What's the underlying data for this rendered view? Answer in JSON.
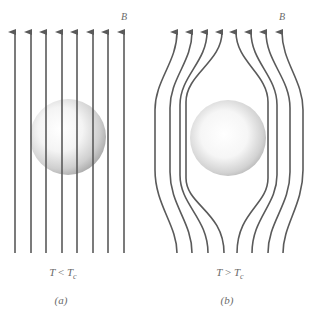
{
  "figure": {
    "line_color": "#5a5a5a",
    "sphere_light": "#ffffff",
    "sphere_dark": "#b0b0b0"
  },
  "panels": [
    {
      "id": "a",
      "field_label": "B",
      "condition": {
        "var": "T",
        "op": "<",
        "sub_var": "T",
        "sub": "c",
        "text": "T < Tc"
      },
      "caption": "(a)",
      "line_count": 8,
      "line_x": [
        15,
        31,
        46,
        62,
        77,
        93,
        108,
        124
      ],
      "sphere": {
        "cx": 68,
        "cy": 137,
        "r": 38
      }
    },
    {
      "id": "b",
      "field_label": "B",
      "condition": {
        "var": "T",
        "op": ">",
        "sub_var": "T",
        "sub": "c",
        "text": "T > Tc"
      },
      "caption": "(b)",
      "line_count": 8,
      "line_top_x": [
        177,
        192,
        207,
        222,
        236,
        251,
        266,
        282
      ],
      "line_mid_x": [
        155,
        170,
        180,
        186,
        268,
        277,
        290,
        303
      ],
      "sphere": {
        "cx": 228,
        "cy": 138,
        "r": 38
      }
    }
  ]
}
